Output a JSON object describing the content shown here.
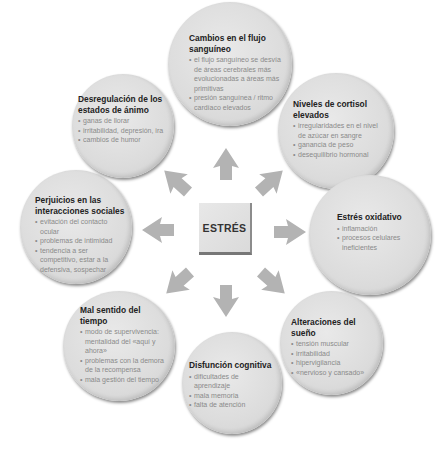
{
  "diagram": {
    "center": {
      "label": "ESTRÉS"
    },
    "colors": {
      "arrow": "#b3b3b3",
      "bubble": "#dcdcdc",
      "title": "#222222",
      "bullet_text": "#8a8a8a"
    },
    "effects": [
      {
        "id": "blood-flow",
        "title": "Cambios en el flujo sanguíneo",
        "points": [
          "el flujo sanguíneo se desvía de áreas cerebrales más evolucionadas a áreas más primitivas",
          "presión sanguínea / ritmo cardíaco elevados"
        ]
      },
      {
        "id": "cortisol",
        "title": "Niveles de cortisol elevados",
        "points": [
          "irregularidades en el nivel de azúcar en sangre",
          "ganancia de peso",
          "desequilibrio hormonal"
        ]
      },
      {
        "id": "oxidative-stress",
        "title": "Estrés oxidativo",
        "points": [
          "inflamación",
          "procesos celulares ineficientes"
        ]
      },
      {
        "id": "sleep",
        "title": "Alteraciones del sueño",
        "points": [
          "tensión muscular",
          "irritabilidad",
          "hipervigilancia",
          "«nervioso y cansado»"
        ]
      },
      {
        "id": "cognitive",
        "title": "Disfunción cognitiva",
        "points": [
          "dificultades de aprendizaje",
          "mala memoria",
          "falta de atención"
        ]
      },
      {
        "id": "time-sense",
        "title": "Mal sentido del tiempo",
        "points": [
          "modo de supervivencia: mentalidad del «aquí y ahora»",
          "problemas con la demora de la recompensa",
          "mala gestión del tiempo"
        ]
      },
      {
        "id": "social",
        "title": "Perjuicios en las interacciones sociales",
        "points": [
          "evitación del contacto ocular",
          "problemas de intimidad",
          "tendencia a ser competitivo, estar a la defensiva, sospechar"
        ]
      },
      {
        "id": "mood",
        "title": "Desregulación de los estados de ánimo",
        "points": [
          "ganas de llorar",
          "irritabilidad, depresión, ira",
          "cambios de humor"
        ]
      }
    ]
  }
}
